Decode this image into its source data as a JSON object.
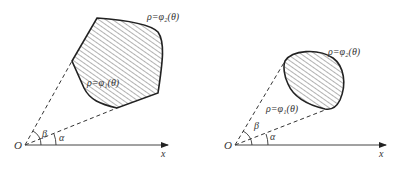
{
  "diagrams": [
    {
      "name": "polygon-region",
      "origin_label": "O",
      "x_axis_label": "x",
      "alpha_label": "α",
      "beta_label": "β",
      "outer_curve_label": "ρ=φ₂(θ)",
      "inner_curve_label": "ρ=φ₁(θ)"
    },
    {
      "name": "oval-region",
      "origin_label": "O",
      "x_axis_label": "x",
      "alpha_label": "α",
      "beta_label": "β",
      "outer_curve_label": "ρ=φ₂(θ)",
      "inner_curve_label": "ρ=φ₁(θ)"
    }
  ],
  "colors": {
    "stroke": "#222222",
    "hatch": "#555555",
    "axis": "#444444"
  }
}
